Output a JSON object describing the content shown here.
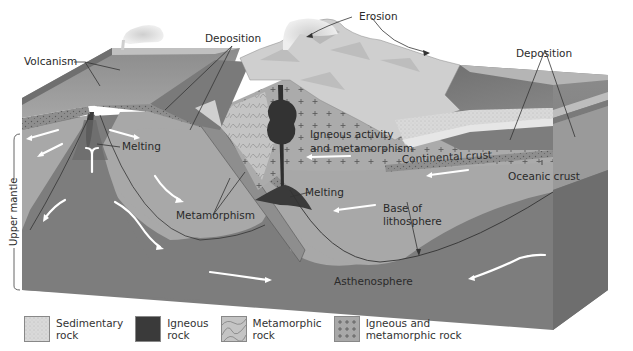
{
  "figure": {
    "colors": {
      "background": "#ffffff",
      "asthenosphere": "#7d7d7d",
      "lithosphere_mantle": "#a3a3a3",
      "oceanic_crust": "#8a8a8a",
      "continental_crust": "#b4b4b4",
      "surface_top": "#9a9a9a",
      "sediment": "#d6d6d6",
      "mountains": "#cfcfcf",
      "igneous": "#3a3a3a",
      "flow_arrows": "#ffffff",
      "text": "#2a2a2a"
    }
  },
  "labels": {
    "volcanism": "Volcanism",
    "deposition_left": "Deposition",
    "erosion": "Erosion",
    "deposition_right": "Deposition",
    "melting_left": "Melting",
    "igneous_line1": "Igneous activity",
    "igneous_line2": "and metamorphism",
    "continental_crust": "Continental crust",
    "oceanic_crust": "Oceanic crust",
    "metamorphism": "Metamorphism",
    "melting_center": "Melting",
    "base_line1": "Base of",
    "base_line2": "lithosphere",
    "asthenosphere": "Asthenosphere",
    "upper_mantle": "Upper mantle"
  },
  "legend": {
    "items": [
      {
        "label": "Sedimentary\nrock",
        "swatch": "sedimentary-rock"
      },
      {
        "label": "Igneous\nrock",
        "swatch": "igneous-rock"
      },
      {
        "label": "Metamorphic\nrock",
        "swatch": "metamorphic-rock"
      },
      {
        "label": "Igneous and\nmetamorphic rock",
        "swatch": "igneous-metamorphic-rock"
      }
    ]
  }
}
